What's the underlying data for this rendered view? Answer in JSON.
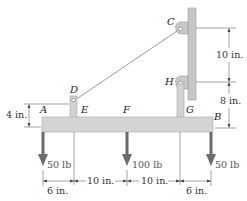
{
  "points": {
    "A": "A",
    "B": "B",
    "C": "C",
    "D": "D",
    "E": "E",
    "F": "F",
    "G": "G",
    "H": "H"
  },
  "dimensions": {
    "c_to_h": "10 in.",
    "h_to_b": "8 in.",
    "d_height": "4 in.",
    "a_to_e": "6 in.",
    "e_to_f": "10 in.",
    "f_to_g": "10 in.",
    "g_to_b": "6 in."
  },
  "loads": {
    "at_a": "50 lb",
    "at_f": "100 lb",
    "at_b": "50 lb"
  },
  "colors": {
    "beam": "#d4d4d4",
    "beam_stroke": "#a8a8a8",
    "wall": "#c8c8c8",
    "arrow": "#6b6b6b",
    "cable": "#9a9a9a",
    "dim_line": "#444444"
  }
}
